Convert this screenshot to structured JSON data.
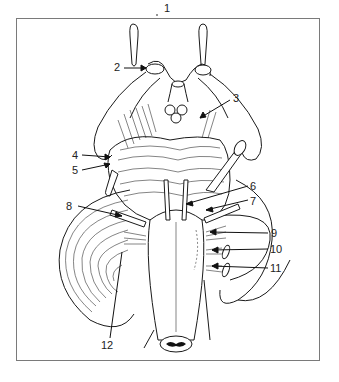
{
  "figure": {
    "type": "anatomical line drawing",
    "frame_color": "#7a7a7a",
    "line_color": "#1a1a1a",
    "labels": [
      {
        "id": "1",
        "text": "1",
        "x": 164,
        "y": 3
      },
      {
        "id": "2",
        "text": "2",
        "x": 114,
        "y": 62
      },
      {
        "id": "3",
        "text": "3",
        "x": 233,
        "y": 93
      },
      {
        "id": "4",
        "text": "4",
        "x": 72,
        "y": 150
      },
      {
        "id": "5",
        "text": "5",
        "x": 72,
        "y": 165
      },
      {
        "id": "6",
        "text": "6",
        "x": 250,
        "y": 181
      },
      {
        "id": "7",
        "text": "7",
        "x": 250,
        "y": 196
      },
      {
        "id": "8",
        "text": "8",
        "x": 66,
        "y": 201
      },
      {
        "id": "9",
        "text": "9",
        "x": 271,
        "y": 228
      },
      {
        "id": "10",
        "text": "10",
        "x": 270,
        "y": 244
      },
      {
        "id": "11",
        "text": "11",
        "x": 270,
        "y": 263
      },
      {
        "id": "12",
        "text": "12",
        "x": 101,
        "y": 340
      }
    ]
  }
}
